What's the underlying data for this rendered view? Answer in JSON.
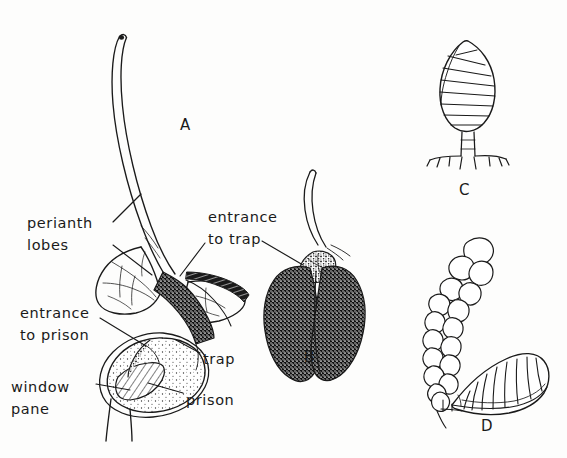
{
  "figure": {
    "caption_type": "botanical-line-drawing",
    "background_color": "#fdfdfc",
    "ink_color": "#1a1a1a",
    "panels": [
      {
        "id": "A",
        "letter": "A",
        "x": 180,
        "y": 116,
        "subject": "longitudinal-section-of-trap-flower"
      },
      {
        "id": "B",
        "letter": "B",
        "x": 304,
        "y": 348,
        "subject": "whole-flower-external-view"
      },
      {
        "id": "C",
        "letter": "C",
        "x": 459,
        "y": 181,
        "subject": "banded-ovoid-body-on-stalk"
      },
      {
        "id": "D",
        "letter": "D",
        "x": 481,
        "y": 417,
        "subject": "banded-cone-with-vesicle-chain"
      }
    ],
    "labels": [
      {
        "id": "perianth-lobes",
        "lines": [
          "perianth",
          "lobes"
        ],
        "x": 27,
        "y": 212,
        "align": "left"
      },
      {
        "id": "entrance-to-trap",
        "lines": [
          "entrance",
          "to trap"
        ],
        "x": 208,
        "y": 206,
        "align": "left"
      },
      {
        "id": "entrance-to-prison",
        "lines": [
          "entrance",
          "to prison"
        ],
        "x": 20,
        "y": 302,
        "align": "left"
      },
      {
        "id": "trap",
        "lines": [
          "trap"
        ],
        "x": 203,
        "y": 348,
        "align": "left"
      },
      {
        "id": "window-pane",
        "lines": [
          "window",
          "pane"
        ],
        "x": 11,
        "y": 376,
        "align": "left"
      },
      {
        "id": "prison",
        "lines": [
          "prison"
        ],
        "x": 186,
        "y": 389,
        "align": "left"
      }
    ],
    "leader_lines": [
      {
        "id": "perianth-lobes-upper",
        "from": [
          113,
          222
        ],
        "to": [
          141,
          194
        ]
      },
      {
        "id": "perianth-lobes-lower",
        "from": [
          113,
          245
        ],
        "to": [
          152,
          275
        ]
      },
      {
        "id": "entrance-to-trap-left",
        "from": [
          205,
          243
        ],
        "to": [
          180,
          276
        ]
      },
      {
        "id": "entrance-to-trap-right",
        "from": [
          262,
          241
        ],
        "to": [
          303,
          265
        ]
      },
      {
        "id": "entrance-to-prison",
        "from": [
          100,
          318
        ],
        "to": [
          146,
          346
        ]
      },
      {
        "id": "trap",
        "from": [
          200,
          353
        ],
        "to": [
          176,
          340
        ]
      },
      {
        "id": "window-pane",
        "from": [
          96,
          384
        ],
        "to": [
          130,
          390
        ]
      },
      {
        "id": "prison",
        "from": [
          183,
          393
        ],
        "to": [
          148,
          383
        ]
      }
    ]
  }
}
